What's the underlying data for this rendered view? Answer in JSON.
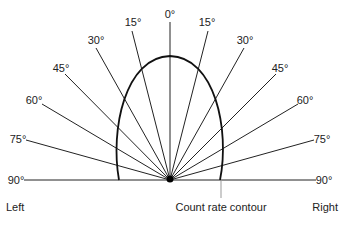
{
  "diagram": {
    "angles": [
      {
        "label": "0°",
        "x": 170,
        "y": 18,
        "anchor": "middle"
      },
      {
        "label": "15°",
        "x": 133,
        "y": 26,
        "anchor": "middle"
      },
      {
        "label": "15°",
        "x": 207,
        "y": 26,
        "anchor": "middle"
      },
      {
        "label": "30°",
        "x": 96,
        "y": 44,
        "anchor": "middle"
      },
      {
        "label": "30°",
        "x": 245,
        "y": 44,
        "anchor": "middle"
      },
      {
        "label": "45°",
        "x": 61,
        "y": 72,
        "anchor": "middle"
      },
      {
        "label": "45°",
        "x": 280,
        "y": 72,
        "anchor": "middle"
      },
      {
        "label": "60°",
        "x": 34,
        "y": 104,
        "anchor": "middle"
      },
      {
        "label": "60°",
        "x": 305,
        "y": 104,
        "anchor": "middle"
      },
      {
        "label": "75°",
        "x": 18,
        "y": 143,
        "anchor": "middle"
      },
      {
        "label": "75°",
        "x": 322,
        "y": 143,
        "anchor": "middle"
      },
      {
        "label": "90°",
        "x": 16,
        "y": 184,
        "anchor": "middle"
      },
      {
        "label": "90°",
        "x": 324,
        "y": 184,
        "anchor": "middle"
      }
    ],
    "side_left": "Left",
    "side_right": "Right",
    "contour_label": "Count rate contour"
  }
}
